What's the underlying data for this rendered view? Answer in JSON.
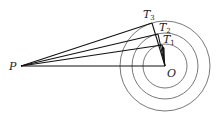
{
  "diagram": {
    "colors": {
      "line": "#111111",
      "circle": "#555555",
      "background": "#ffffff"
    },
    "points": {
      "P": {
        "label": "P",
        "x": 21,
        "y": 66
      },
      "O": {
        "label": "O",
        "x": 165,
        "y": 66
      },
      "T1": {
        "label": "T",
        "sub": "1",
        "x": 162,
        "y": 45
      },
      "T2": {
        "label": "T",
        "sub": "2",
        "x": 158,
        "y": 34
      },
      "T3": {
        "label": "T",
        "sub": "3",
        "x": 152,
        "y": 23
      }
    },
    "circles": [
      {
        "name": "inner",
        "cx": 165,
        "cy": 66,
        "r": 22
      },
      {
        "name": "middle",
        "cx": 165,
        "cy": 66,
        "r": 33
      },
      {
        "name": "outer",
        "cx": 165,
        "cy": 66,
        "r": 45
      }
    ],
    "segments": [
      {
        "name": "PO",
        "from": "P",
        "to": "O"
      },
      {
        "name": "PT1",
        "from": "P",
        "to": "T1"
      },
      {
        "name": "PT2",
        "from": "P",
        "to": "T2"
      },
      {
        "name": "PT3",
        "from": "P",
        "to": "T3"
      },
      {
        "name": "OT1",
        "from": "O",
        "to": "T1"
      },
      {
        "name": "OT2",
        "from": "O",
        "to": "T2"
      },
      {
        "name": "OT3",
        "from": "O",
        "to": "T3"
      }
    ],
    "labels": {
      "P": "P",
      "O": "O",
      "T1": "T",
      "T1_sub": "1",
      "T2": "T",
      "T2_sub": "2",
      "T3": "T",
      "T3_sub": "3"
    }
  }
}
